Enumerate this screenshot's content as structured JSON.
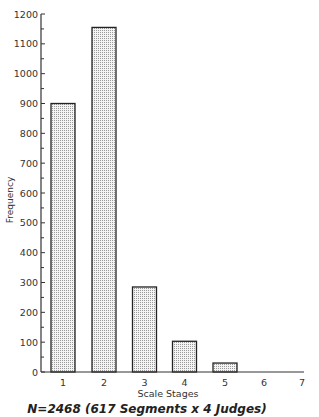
{
  "chart_data": {
    "type": "bar",
    "title": "",
    "xlabel": "Scale Stages",
    "ylabel": "Frequency",
    "categories": [
      "1",
      "2",
      "3",
      "4",
      "5",
      "6",
      "7"
    ],
    "values": [
      900,
      1155,
      285,
      103,
      30,
      0,
      0
    ],
    "ylim": [
      0,
      1200
    ],
    "yticks": [
      0,
      100,
      200,
      300,
      400,
      500,
      600,
      700,
      800,
      900,
      1000,
      1100,
      1200
    ],
    "grid": false,
    "legend": null,
    "bar_fill": "dotted-gray",
    "annotation": "N=2468 (617 Segments x 4 Judges)"
  },
  "labels": {
    "xlabel": "Scale Stages",
    "ylabel": "Frequency",
    "annotation": "N=2468 (617 Segments x 4 Judges)"
  }
}
